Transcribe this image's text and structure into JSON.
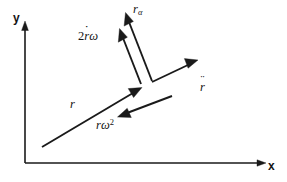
{
  "figure": {
    "name": "rotating-frame-acceleration-diagram",
    "background_color": "#ffffff",
    "ink_color": "#1a1a1a",
    "width": 287,
    "height": 182
  },
  "axes": {
    "x_label": "x",
    "y_label": "y",
    "origin": {
      "x": 25,
      "y": 163
    },
    "x_end": {
      "x": 266,
      "y": 163
    },
    "y_end": {
      "x": 25,
      "y": 22
    }
  },
  "vectors": [
    {
      "id": "r",
      "label": "r",
      "label_parts": {
        "base": "r",
        "dots": 0,
        "sub": "",
        "sup": "",
        "coefficient": ""
      },
      "description": "position / radial vector",
      "from": {
        "x": 42,
        "y": 147
      },
      "to": {
        "x": 141,
        "y": 88
      },
      "label_pos": {
        "x": 70,
        "y": 104
      }
    },
    {
      "id": "r-ddot",
      "label": "r̈",
      "label_parts": {
        "base": "r",
        "dots": 2,
        "sub": "",
        "sup": "",
        "coefficient": ""
      },
      "description": "total acceleration vector",
      "from": {
        "x": 152,
        "y": 82
      },
      "to": {
        "x": 197,
        "y": 60
      },
      "label_pos": {
        "x": 200,
        "y": 87
      }
    },
    {
      "id": "r-omega-squared",
      "label": "rω²",
      "label_parts": {
        "base": "r",
        "dots": 0,
        "sub": "",
        "sup": "2",
        "coefficient": "",
        "greek": "ω"
      },
      "description": "centripetal acceleration component",
      "from": {
        "x": 172,
        "y": 96
      },
      "to": {
        "x": 118,
        "y": 117
      },
      "label_pos": {
        "x": 97,
        "y": 124
      }
    },
    {
      "id": "two-rdot-omega",
      "label": "2ṙω",
      "label_parts": {
        "base": "r",
        "dots": 1,
        "sub": "",
        "sup": "",
        "coefficient": "2",
        "greek": "ω"
      },
      "description": "Coriolis acceleration component",
      "from": {
        "x": 141,
        "y": 84
      },
      "to": {
        "x": 120,
        "y": 29
      },
      "label_pos": {
        "x": 78,
        "y": 36
      }
    },
    {
      "id": "r-alpha",
      "label": "rα",
      "label_parts": {
        "base": "r",
        "dots": 0,
        "sub": "α",
        "sup": "",
        "coefficient": "",
        "greek": "α"
      },
      "description": "tangential / angular acceleration component",
      "from": {
        "x": 152,
        "y": 81
      },
      "to": {
        "x": 126,
        "y": 13
      },
      "label_pos": {
        "x": 133,
        "y": 5
      }
    }
  ]
}
